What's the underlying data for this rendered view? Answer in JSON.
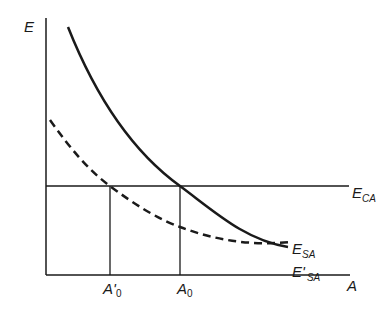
{
  "diagram": {
    "axes": {
      "y_label": "E",
      "x_label": "A"
    },
    "curves": {
      "horizontal_line": {
        "label_main": "E",
        "label_sub": "CA"
      },
      "solid_curve": {
        "label_main": "E",
        "label_sub": "SA"
      },
      "dashed_curve": {
        "label_main": "E'",
        "label_sub": "SA"
      }
    },
    "x_ticks": {
      "a_prime_0": {
        "main": "A'",
        "sub": "0"
      },
      "a_0": {
        "main": "A",
        "sub": "0"
      }
    },
    "colors": {
      "line": "#1a1a1a",
      "background": "#ffffff"
    }
  }
}
